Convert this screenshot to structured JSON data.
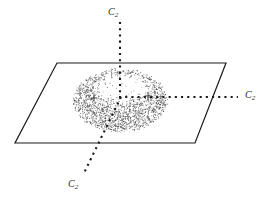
{
  "figure": {
    "background_color": "#ffffff",
    "width": 269,
    "height": 202
  },
  "labels": {
    "top_axis": "C",
    "top_axis_sub": "2",
    "right_axis": "C",
    "right_axis_sub": "2",
    "bottom_axis": "C",
    "bottom_axis_sub": "2"
  },
  "colors": {
    "plane_outline": "#1a1a1a",
    "axis_dots": "#1a1a1a",
    "stipple": "#4a4a4a",
    "label_text": "#2b2b2b",
    "background": "#ffffff"
  },
  "geometry": {
    "plane_polygon": [
      [
        57,
        63
      ],
      [
        226,
        63
      ],
      [
        195,
        143
      ],
      [
        15,
        143
      ]
    ],
    "center": [
      120,
      98
    ],
    "axes": [
      {
        "name": "vertical-c2-axis",
        "from": [
          120,
          22
        ],
        "to": [
          120,
          98
        ],
        "label": "C2"
      },
      {
        "name": "horizontal-c2-axis",
        "from": [
          120,
          97
        ],
        "to": [
          238,
          97
        ],
        "label": "C2"
      },
      {
        "name": "diagonal-c2-axis",
        "from": [
          120,
          98
        ],
        "to": [
          84,
          172
        ],
        "label": "C2"
      }
    ],
    "torus": {
      "outer_center": [
        120,
        100
      ],
      "outer_rx": 48,
      "outer_ry": 32,
      "hole_center": [
        123,
        88
      ],
      "hole_rx": 24,
      "hole_ry": 12
    },
    "plus_markers": [
      [
        94,
        98
      ],
      [
        148,
        96
      ]
    ]
  },
  "chart_data": {
    "type": "scatter",
    "title": "",
    "xlabel": "",
    "ylabel": "",
    "series": [
      {
        "name": "stippled-torus",
        "description": "dense random stipple forming an elliptical annulus (torus seen in perspective)"
      }
    ],
    "annotations": [
      "C2",
      "C2",
      "C2"
    ]
  }
}
